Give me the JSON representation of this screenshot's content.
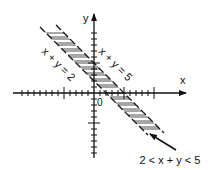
{
  "diagram": {
    "type": "inequality-region-plot",
    "axes": {
      "x_label": "x",
      "y_label": "y",
      "origin_label": "0",
      "x_range": [
        -13,
        16
      ],
      "y_range": [
        -11,
        13
      ],
      "tick_spacing_units": 1,
      "major_tick_every": 5
    },
    "lines": [
      {
        "equation": "x + y = 2",
        "label": "x + y = 2",
        "style": "dashed",
        "intercept": 2
      },
      {
        "equation": "x + y = 5",
        "label": "x + y = 5",
        "style": "solid",
        "intercept": 5
      }
    ],
    "region": {
      "label": "2 < x + y < 5",
      "fill": "diagonal-hatch",
      "bounds": [
        2,
        5
      ]
    },
    "colors": {
      "stroke": "#111111",
      "background": "#ffffff"
    }
  }
}
